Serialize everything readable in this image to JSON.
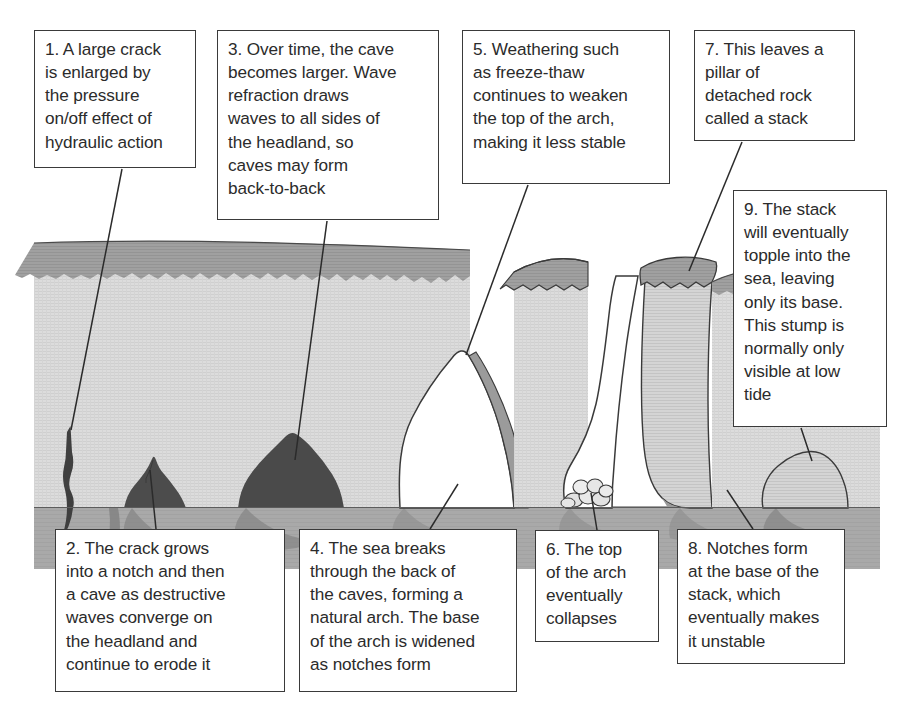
{
  "diagram": {
    "annotations": [
      {
        "id": 1,
        "text": "1. A large crack\nis enlarged by\nthe pressure\non/off effect of\nhydraulic action"
      },
      {
        "id": 2,
        "text": "2. The crack grows\ninto a notch and then\na cave as destructive\nwaves converge on\nthe headland and\ncontinue to erode it"
      },
      {
        "id": 3,
        "text": "3. Over time, the cave\nbecomes larger. Wave\nrefraction draws\nwaves to all sides of\nthe headland, so\ncaves may form\nback-to-back"
      },
      {
        "id": 4,
        "text": "4. The sea breaks\nthrough the back of\nthe caves, forming a\nnatural arch. The base\nof the arch is widened\nas notches form"
      },
      {
        "id": 5,
        "text": "5. Weathering such\nas freeze-thaw\ncontinues to weaken\nthe top of the arch,\nmaking it less stable"
      },
      {
        "id": 6,
        "text": "6. The top\nof the arch\neventually\ncollapses"
      },
      {
        "id": 7,
        "text": "7. This leaves a\npillar of\ndetached rock\ncalled a stack"
      },
      {
        "id": 8,
        "text": "8. Notches form\nat the base of the\nstack, which\neventually makes\nit unstable"
      },
      {
        "id": 9,
        "text": "9. The stack\nwill eventually\ntopple into the\nsea, leaving\nonly its base.\nThis stump is\nnormally only\nvisible at low\ntide"
      }
    ],
    "features": [
      {
        "name": "crack",
        "label_ref": 1
      },
      {
        "name": "notch",
        "label_ref": 2
      },
      {
        "name": "cave",
        "label_ref": 3
      },
      {
        "name": "arch",
        "label_ref": 4
      },
      {
        "name": "arch-top",
        "label_ref": 5
      },
      {
        "name": "collapsed-arch-rubble",
        "label_ref": 6
      },
      {
        "name": "stack",
        "label_ref": 7
      },
      {
        "name": "stack-notch",
        "label_ref": 8
      },
      {
        "name": "stump",
        "label_ref": 9
      }
    ],
    "colors": {
      "sky": "#ffffff",
      "cliff_face": "#d9d9d9",
      "cliff_top": "#9d9d9d",
      "cave_dark": "#4a4a4a",
      "sea": "#a8a8a8",
      "sea_reflection": "#8e8e8e",
      "outline": "#3a3a3a",
      "box_border": "#3a3a3a",
      "text": "#2b2b2b"
    }
  }
}
